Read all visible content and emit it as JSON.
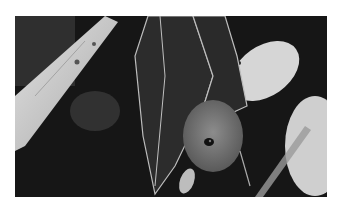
{
  "image": {
    "subject": "fruit bat hanging upside down",
    "alt": "Grayscale photo of a fruit bat hanging upside down with wings folded, next to a pale branch and leaves",
    "colors": {
      "background": "#ffffff",
      "dark": "#141414",
      "wing": "#2e2e2e",
      "fur": "#7a7a7a",
      "branch": "#cfcfcf",
      "leaf": "#d8d8d8"
    }
  }
}
